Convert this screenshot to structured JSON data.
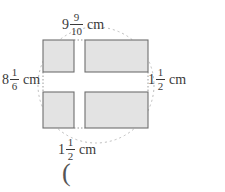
{
  "figure": {
    "type": "geometry-diagram",
    "colors": {
      "rect_fill": "#e3e3e3",
      "rect_stroke": "#6f6f6f",
      "dashed_circle_stroke": "#b9b9b9",
      "text": "#3a3a3a",
      "background": "#ffffff"
    },
    "dashed_circle": {
      "center_x": 96,
      "center_y": 85,
      "radius": 58,
      "dash": "2,3"
    },
    "rectangles": [
      {
        "name": "top-left",
        "x": 43,
        "y": 40,
        "width": 31,
        "height": 32
      },
      {
        "name": "top-right",
        "x": 85,
        "y": 40,
        "width": 63,
        "height": 32
      },
      {
        "name": "bottom-left",
        "x": 43,
        "y": 92,
        "width": 31,
        "height": 36
      },
      {
        "name": "bottom-right",
        "x": 85,
        "y": 92,
        "width": 63,
        "height": 36
      }
    ]
  },
  "labels": {
    "top": {
      "name": "top-dimension",
      "whole": "9",
      "numerator": "9",
      "denominator": "10",
      "unit": "cm",
      "full_text": "9 9/10 cm"
    },
    "left": {
      "name": "left-dimension",
      "whole": "8",
      "numerator": "1",
      "denominator": "6",
      "unit": "cm",
      "full_text": "8 1/6 cm"
    },
    "right": {
      "name": "right-dimension",
      "whole": "1",
      "numerator": "1",
      "denominator": "2",
      "unit": "cm",
      "full_text": "1 1/2 cm"
    },
    "bottom": {
      "name": "bottom-dimension",
      "whole": "1",
      "numerator": "1",
      "denominator": "2",
      "unit": "cm",
      "full_text": "1 1/2 cm"
    }
  },
  "annotations": {
    "open_paren": "("
  }
}
